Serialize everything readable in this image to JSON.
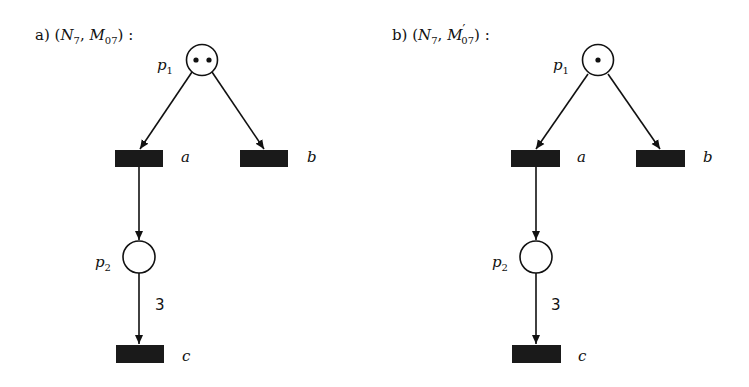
{
  "diagrams": [
    {
      "label": "a)",
      "title_net": "N",
      "title_net_sub": "7",
      "title_marking": "M",
      "title_marking_prime": "",
      "title_marking_sub": "07",
      "title_suffix": ":",
      "places": [
        {
          "id": "p1",
          "name": "p",
          "sub": "1",
          "tokens": 2
        },
        {
          "id": "p2",
          "name": "p",
          "sub": "2",
          "tokens": 0
        }
      ],
      "transitions": [
        {
          "id": "a",
          "name": "a"
        },
        {
          "id": "b",
          "name": "b"
        },
        {
          "id": "c",
          "name": "c"
        }
      ],
      "arcs": [
        {
          "from": "p1",
          "to": "a",
          "weight": ""
        },
        {
          "from": "p1",
          "to": "b",
          "weight": ""
        },
        {
          "from": "a",
          "to": "p2",
          "weight": ""
        },
        {
          "from": "p2",
          "to": "c",
          "weight": "3"
        }
      ]
    },
    {
      "label": "b)",
      "title_net": "N",
      "title_net_sub": "7",
      "title_marking": "M",
      "title_marking_prime": "′",
      "title_marking_sub": "07",
      "title_suffix": ":",
      "places": [
        {
          "id": "p1",
          "name": "p",
          "sub": "1",
          "tokens": 1
        },
        {
          "id": "p2",
          "name": "p",
          "sub": "2",
          "tokens": 0
        }
      ],
      "transitions": [
        {
          "id": "a",
          "name": "a"
        },
        {
          "id": "b",
          "name": "b"
        },
        {
          "id": "c",
          "name": "c"
        }
      ],
      "arcs": [
        {
          "from": "p1",
          "to": "a",
          "weight": ""
        },
        {
          "from": "p1",
          "to": "b",
          "weight": ""
        },
        {
          "from": "a",
          "to": "p2",
          "weight": ""
        },
        {
          "from": "p2",
          "to": "c",
          "weight": "3"
        }
      ]
    }
  ]
}
